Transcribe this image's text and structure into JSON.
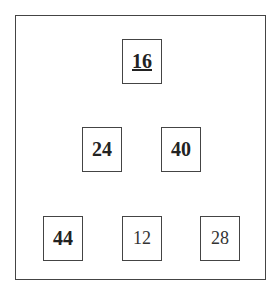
{
  "diagram": {
    "type": "binary-heap-tree",
    "nodes": [
      {
        "id": "n0",
        "value": "16",
        "bold": true,
        "underline": true,
        "level": 0
      },
      {
        "id": "n1",
        "value": "24",
        "bold": true,
        "underline": false,
        "level": 1
      },
      {
        "id": "n2",
        "value": "40",
        "bold": true,
        "underline": false,
        "level": 1
      },
      {
        "id": "n3",
        "value": "44",
        "bold": true,
        "underline": false,
        "level": 2
      },
      {
        "id": "n4",
        "value": "12",
        "bold": false,
        "underline": false,
        "level": 2
      },
      {
        "id": "n5",
        "value": "28",
        "bold": false,
        "underline": false,
        "level": 2
      }
    ]
  }
}
